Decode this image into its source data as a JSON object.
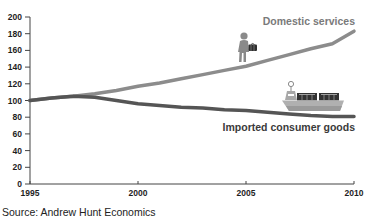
{
  "chart_data": {
    "type": "line",
    "title": "",
    "xlabel": "",
    "ylabel": "",
    "x": [
      1995,
      1996,
      1997,
      1998,
      1999,
      2000,
      2001,
      2002,
      2003,
      2004,
      2005,
      2006,
      2007,
      2008,
      2009,
      2010
    ],
    "series": [
      {
        "name": "Domestic services",
        "color": "#8c8c8c",
        "values": [
          100,
          103,
          105,
          108,
          112,
          117,
          121,
          126,
          131,
          136,
          141,
          148,
          155,
          162,
          168,
          183
        ]
      },
      {
        "name": "Imported consumer goods",
        "color": "#555555",
        "values": [
          100,
          103,
          105,
          104,
          100,
          96,
          94,
          92,
          91,
          89,
          88,
          86,
          84,
          82,
          81,
          81
        ]
      }
    ],
    "x_ticks": [
      1995,
      2000,
      2005,
      2010
    ],
    "y_ticks": [
      0,
      20,
      40,
      60,
      80,
      100,
      120,
      140,
      160,
      180,
      200
    ],
    "xlim": [
      1995,
      2010
    ],
    "ylim": [
      0,
      200
    ],
    "grid": false,
    "legend_position": "inline labels at right end of each line",
    "annotations": [
      {
        "text": "Domestic services",
        "near": "end of Domestic services line (top right)"
      },
      {
        "text": "Imported consumer goods",
        "near": "end of Imported consumer goods line (below)"
      },
      {
        "icon": "walking-man-with-briefcase-icon",
        "near": "Domestic services line around 2005"
      },
      {
        "icon": "container-ship-icon",
        "near": "Imported consumer goods line around 2008-2010"
      }
    ],
    "source": "Source: Andrew Hunt Economics"
  },
  "labels": {
    "domestic": "Domestic services",
    "imported": "Imported consumer goods",
    "source": "Source: Andrew Hunt Economics"
  },
  "colors": {
    "axis": "#444444",
    "domestic_line": "#8c8c8c",
    "imported_line": "#555555",
    "domestic_label": "#7a7a7a",
    "imported_label": "#3a3a3a",
    "tick_text": "#1e1e1e"
  },
  "icons": {
    "domestic": "walking-man-with-briefcase-icon",
    "imported": "container-ship-icon"
  }
}
